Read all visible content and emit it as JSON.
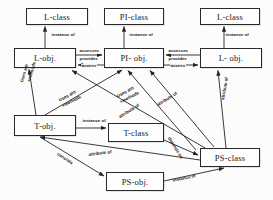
{
  "diagram": {
    "canvas": {
      "width": 273,
      "height": 200
    },
    "stroke_color": "#2a2a2a",
    "box_fill": "#ffffff",
    "nodes": [
      {
        "id": "l-class-left",
        "label": "L-class",
        "x": 26,
        "y": 8,
        "w": 62,
        "h": 17
      },
      {
        "id": "pi-class",
        "label": "PI-class",
        "x": 104,
        "y": 8,
        "w": 60,
        "h": 17
      },
      {
        "id": "l-class-right",
        "label": "L-class",
        "x": 200,
        "y": 8,
        "w": 60,
        "h": 17
      },
      {
        "id": "l-obj-left",
        "label": "L-obj.",
        "x": 14,
        "y": 48,
        "w": 62,
        "h": 20
      },
      {
        "id": "pi-obj",
        "label": "PI- obj.",
        "x": 104,
        "y": 48,
        "w": 60,
        "h": 20
      },
      {
        "id": "l-obj-right",
        "label": "L- obj.",
        "x": 200,
        "y": 48,
        "w": 62,
        "h": 20
      },
      {
        "id": "t-obj",
        "label": "T-obj.",
        "x": 14,
        "y": 115,
        "w": 62,
        "h": 21
      },
      {
        "id": "t-class",
        "label": "T-class",
        "x": 108,
        "y": 123,
        "w": 56,
        "h": 19
      },
      {
        "id": "ps-class",
        "label": "PS-class",
        "x": 200,
        "y": 148,
        "w": 60,
        "h": 19
      },
      {
        "id": "ps-obj",
        "label": "PS-obj.",
        "x": 106,
        "y": 172,
        "w": 58,
        "h": 19
      }
    ],
    "edge_labels": [
      {
        "id": "instance-of-1",
        "text": "instance of",
        "x": 51,
        "y": 33,
        "rot": 0
      },
      {
        "id": "instance-of-2",
        "text": "instance of",
        "x": 129,
        "y": 33,
        "rot": 0
      },
      {
        "id": "instance-of-3",
        "text": "instance of",
        "x": 225,
        "y": 33,
        "rot": 0
      },
      {
        "id": "accesses-1",
        "text": "accesses",
        "x": 79,
        "y": 50,
        "rot": 0
      },
      {
        "id": "provides-1",
        "text": "provides",
        "x": 79,
        "y": 58,
        "rot": 0
      },
      {
        "id": "access-1",
        "text": "access",
        "x": 79,
        "y": 64,
        "rot": 0
      },
      {
        "id": "accesses-2",
        "text": "accesses",
        "x": 167,
        "y": 50,
        "rot": 0
      },
      {
        "id": "provides-2",
        "text": "provides",
        "x": 167,
        "y": 58,
        "rot": 0
      },
      {
        "id": "access-2",
        "text": "access",
        "x": 167,
        "y": 64,
        "rot": 0
      },
      {
        "id": "uses-attr-v1",
        "text": "Uses attr",
        "x": 26,
        "y": 80,
        "rot": -74
      },
      {
        "id": "methods-v1",
        "text": "+methods",
        "x": 33,
        "y": 80,
        "rot": -74
      },
      {
        "id": "uses-attr-d1",
        "text": "Uses attr",
        "x": 63,
        "y": 92,
        "rot": -22
      },
      {
        "id": "methods-d1",
        "text": "+methods",
        "x": 66,
        "y": 100,
        "rot": -22
      },
      {
        "id": "uses-attr-d2",
        "text": "Uses attr",
        "x": 121,
        "y": 90,
        "rot": -22
      },
      {
        "id": "methods-d2",
        "text": "+methods",
        "x": 124,
        "y": 98,
        "rot": -22
      },
      {
        "id": "attribute-of-1",
        "text": "attribute of",
        "x": 122,
        "y": 111,
        "rot": -32
      },
      {
        "id": "attribute-of-2",
        "text": "attribute of",
        "x": 160,
        "y": 99,
        "rot": -32
      },
      {
        "id": "attribute-of-3",
        "text": "attribute of",
        "x": 223,
        "y": 88,
        "rot": -78
      },
      {
        "id": "instance-of-4",
        "text": "instance of",
        "x": 82,
        "y": 120,
        "rot": 0
      },
      {
        "id": "depends-on",
        "text": "depends on",
        "x": 176,
        "y": 140,
        "rot": -60
      },
      {
        "id": "attribute-of-4",
        "text": "attribute of",
        "x": 93,
        "y": 157,
        "rot": -6
      },
      {
        "id": "consists",
        "text": "consists",
        "x": 62,
        "y": 155,
        "rot": -33
      },
      {
        "id": "instance-of-5",
        "text": "instance of",
        "x": 178,
        "y": 177,
        "rot": -12
      }
    ]
  }
}
